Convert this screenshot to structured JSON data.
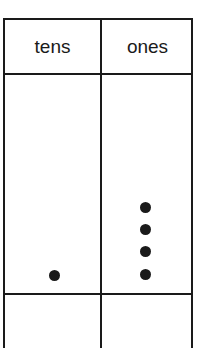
{
  "chart": {
    "columns": [
      {
        "label": "tens",
        "count": 1
      },
      {
        "label": "ones",
        "count": 4
      }
    ],
    "dot_color": "#1a1a1a",
    "line_color": "#1a1a1a"
  }
}
